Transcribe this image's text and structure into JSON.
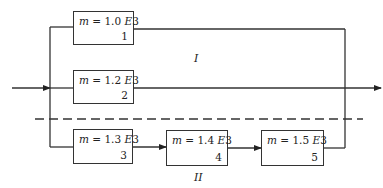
{
  "diagram": {
    "type": "reliability-block-diagram",
    "line_color": "#333333",
    "groups": [
      {
        "id": "I",
        "label": "I"
      },
      {
        "id": "II",
        "label": "II"
      }
    ],
    "blocks": [
      {
        "id": 1,
        "m_symbol": "m",
        "eq": " = 1.0",
        "exp": "E",
        "exp_val": "3",
        "number": "1",
        "group": "I"
      },
      {
        "id": 2,
        "m_symbol": "m",
        "eq": " = 1.2",
        "exp": "E",
        "exp_val": "3",
        "number": "2",
        "group": "I"
      },
      {
        "id": 3,
        "m_symbol": "m",
        "eq": " = 1.3",
        "exp": "E",
        "exp_val": "3",
        "number": "3",
        "group": "II"
      },
      {
        "id": 4,
        "m_symbol": "m",
        "eq": " = 1.4",
        "exp": "E",
        "exp_val": "3",
        "number": "4",
        "group": "II"
      },
      {
        "id": 5,
        "m_symbol": "m",
        "eq": " = 1.5",
        "exp": "E",
        "exp_val": "3",
        "number": "5",
        "group": "II"
      }
    ],
    "edges": [
      {
        "from": "input",
        "to": "split"
      },
      {
        "from": "split",
        "to": 1
      },
      {
        "from": "split",
        "to": 2
      },
      {
        "from": "split",
        "to": 3
      },
      {
        "from": 3,
        "to": 4
      },
      {
        "from": 4,
        "to": 5
      },
      {
        "from": 1,
        "to": "join"
      },
      {
        "from": 2,
        "to": "join"
      },
      {
        "from": 5,
        "to": "join"
      },
      {
        "from": "join",
        "to": "output"
      }
    ]
  }
}
